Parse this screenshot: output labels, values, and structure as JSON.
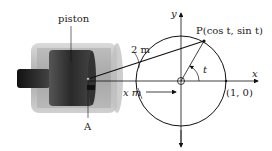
{
  "diagram": {
    "labels": {
      "piston": "piston",
      "point_A": "A",
      "rod_length": "2 m",
      "displacement": "x m",
      "point_P": "P(cos t, sin t)",
      "angle": "t",
      "unit_point": "(1, 0)",
      "x_axis": "x",
      "y_axis": "y"
    },
    "colors": {
      "cylinder_outer": "#b8b8b8",
      "cylinder_inner": "#8a8a8a",
      "piston_body": "#3a3a3a",
      "rod": "#1e1e1e",
      "lines": "#111111",
      "background": "#ffffff"
    }
  }
}
